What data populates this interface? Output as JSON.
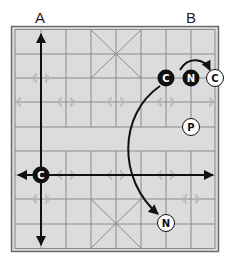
{
  "labels": {
    "a": "A",
    "b": "B"
  },
  "colors": {
    "board_fill": "#dcdcdc",
    "grid_line": "#8a8a8a",
    "border": "#6a6a6a",
    "arrow": "#111111",
    "piece_black": "#111111",
    "piece_white": "#ffffff",
    "point_marker": "#b0b0b0"
  },
  "pieces": [
    {
      "id": "black-cannon-top",
      "letter": "C",
      "side": "black",
      "x": 166,
      "y": 78
    },
    {
      "id": "black-knight-top",
      "letter": "N",
      "side": "black",
      "x": 191,
      "y": 78
    },
    {
      "id": "white-cannon-top",
      "letter": "C",
      "side": "white",
      "x": 215,
      "y": 78
    },
    {
      "id": "white-pawn",
      "letter": "P",
      "side": "white",
      "x": 191,
      "y": 127
    },
    {
      "id": "black-cannon-left",
      "letter": "C",
      "side": "black",
      "x": 41,
      "y": 175
    },
    {
      "id": "white-knight-bottom",
      "letter": "N",
      "side": "white",
      "x": 166,
      "y": 223
    }
  ]
}
